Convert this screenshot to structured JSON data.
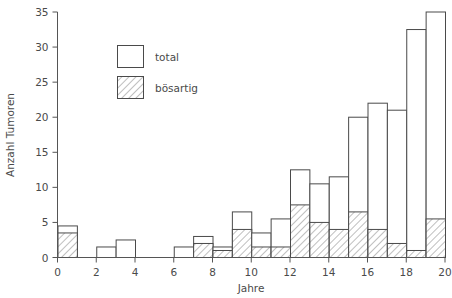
{
  "chart_data": {
    "type": "bar",
    "title": "",
    "subtitle": "",
    "xlabel": "Jahre",
    "ylabel": "Anzahl Tumoren",
    "xlim": [
      0,
      20
    ],
    "ylim": [
      0,
      35
    ],
    "grid": false,
    "legend_position": "upper-left-inside",
    "x_ticks": [
      "0",
      "2",
      "4",
      "6",
      "8",
      "10",
      "12",
      "14",
      "16",
      "18",
      "20"
    ],
    "x_tick_values": [
      0,
      2,
      4,
      6,
      8,
      10,
      12,
      14,
      16,
      18,
      20
    ],
    "y_ticks": [
      "0",
      "5",
      "10",
      "15",
      "20",
      "25",
      "30",
      "35"
    ],
    "y_tick_values": [
      0,
      5,
      10,
      15,
      20,
      25,
      30,
      35
    ],
    "bar_width_years": 1,
    "legend": [
      {
        "name": "total",
        "style": "outline"
      },
      {
        "name": "bösartig",
        "style": "hatched"
      }
    ],
    "series": [
      {
        "name": "total",
        "style": "outline",
        "values": [
          4.5,
          0,
          1.5,
          2.5,
          0,
          0,
          1.5,
          3,
          1.5,
          6.5,
          3.5,
          5.5,
          12.5,
          10.5,
          11.5,
          20,
          22,
          21,
          32.5,
          35
        ]
      },
      {
        "name": "bösartig",
        "style": "hatched",
        "values": [
          3.5,
          0,
          0,
          0,
          0,
          0,
          0,
          2,
          1,
          4,
          1.5,
          1.5,
          7.5,
          5,
          4,
          6.5,
          4,
          2,
          1,
          5.5
        ]
      }
    ],
    "bins": [
      {
        "x0": 0,
        "x1": 1,
        "total": 4.5,
        "boesartig": 3.5
      },
      {
        "x0": 1,
        "x1": 2,
        "total": 0,
        "boesartig": 0
      },
      {
        "x0": 2,
        "x1": 3,
        "total": 1.5,
        "boesartig": 0
      },
      {
        "x0": 3,
        "x1": 4,
        "total": 2.5,
        "boesartig": 0
      },
      {
        "x0": 4,
        "x1": 5,
        "total": 0,
        "boesartig": 0
      },
      {
        "x0": 5,
        "x1": 6,
        "total": 0,
        "boesartig": 0
      },
      {
        "x0": 6,
        "x1": 7,
        "total": 1.5,
        "boesartig": 0
      },
      {
        "x0": 7,
        "x1": 8,
        "total": 3,
        "boesartig": 2
      },
      {
        "x0": 8,
        "x1": 9,
        "total": 1.5,
        "boesartig": 1
      },
      {
        "x0": 9,
        "x1": 10,
        "total": 6.5,
        "boesartig": 4
      },
      {
        "x0": 10,
        "x1": 11,
        "total": 3.5,
        "boesartig": 1.5
      },
      {
        "x0": 11,
        "x1": 12,
        "total": 5.5,
        "boesartig": 1.5
      },
      {
        "x0": 12,
        "x1": 13,
        "total": 12.5,
        "boesartig": 7.5
      },
      {
        "x0": 13,
        "x1": 14,
        "total": 10.5,
        "boesartig": 5
      },
      {
        "x0": 14,
        "x1": 15,
        "total": 11.5,
        "boesartig": 4
      },
      {
        "x0": 15,
        "x1": 16,
        "total": 20,
        "boesartig": 6.5
      },
      {
        "x0": 16,
        "x1": 17,
        "total": 22,
        "boesartig": 4
      },
      {
        "x0": 17,
        "x1": 18,
        "total": 21,
        "boesartig": 2
      },
      {
        "x0": 18,
        "x1": 19,
        "total": 32.5,
        "boesartig": 1
      },
      {
        "x0": 19,
        "x1": 20,
        "total": 35,
        "boesartig": 5.5
      }
    ],
    "colors": {
      "axis": "#555555",
      "bar_stroke": "#4a4a4a",
      "bar_fill": "#ffffff",
      "hatch": "#777777",
      "text": "#4a4a4a",
      "background": "#ffffff"
    }
  }
}
